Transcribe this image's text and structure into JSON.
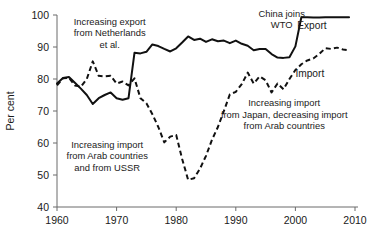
{
  "chart_data": {
    "type": "line",
    "title": "",
    "xlabel": "",
    "ylabel": "Per cent",
    "xlim": [
      1960,
      2010
    ],
    "ylim": [
      40,
      100
    ],
    "grid": false,
    "legend_position": "inline-labels",
    "xticks": [
      "1960",
      "1970",
      "1980",
      "1990",
      "2000",
      "2010"
    ],
    "yticks": [
      "40",
      "50",
      "60",
      "70",
      "80",
      "90",
      "100"
    ],
    "x": [
      1960,
      1961,
      1962,
      1963,
      1964,
      1965,
      1966,
      1967,
      1968,
      1969,
      1970,
      1971,
      1972,
      1973,
      1974,
      1975,
      1976,
      1977,
      1978,
      1979,
      1980,
      1981,
      1982,
      1983,
      1984,
      1985,
      1986,
      1987,
      1988,
      1989,
      1990,
      1991,
      1992,
      1993,
      1994,
      1995,
      1996,
      1997,
      1998,
      1999,
      2000,
      2001,
      2002,
      2003,
      2004,
      2005,
      2006,
      2007,
      2008,
      2009
    ],
    "series": [
      {
        "name": "Export",
        "style": "solid",
        "values": [
          78.6,
          80.3,
          80.6,
          78.8,
          77.0,
          75.0,
          72.2,
          74.0,
          75.0,
          75.8,
          74.0,
          73.5,
          74.0,
          88.2,
          88.0,
          88.5,
          90.8,
          90.3,
          89.4,
          88.6,
          89.6,
          91.4,
          93.3,
          92.2,
          92.6,
          91.6,
          92.4,
          91.8,
          92.0,
          91.2,
          92.0,
          91.0,
          90.4,
          89.0,
          89.4,
          89.4,
          87.8,
          86.7,
          86.6,
          86.8,
          90.2,
          99.3,
          99.3,
          99.2,
          99.2,
          99.3,
          99.3,
          99.3,
          99.3,
          99.3
        ]
      },
      {
        "name": "Import",
        "style": "dashed",
        "values": [
          78.0,
          80.2,
          80.4,
          78.0,
          77.6,
          80.0,
          85.5,
          81.0,
          80.8,
          81.0,
          78.6,
          79.2,
          78.0,
          80.2,
          74.0,
          72.4,
          69.0,
          65.0,
          60.2,
          62.0,
          62.5,
          55.0,
          48.5,
          49.0,
          52.0,
          56.0,
          61.0,
          65.0,
          70.0,
          75.2,
          76.0,
          78.4,
          82.0,
          78.6,
          80.8,
          79.6,
          75.8,
          78.6,
          76.8,
          80.0,
          82.8,
          84.6,
          85.8,
          86.4,
          87.8,
          89.6,
          89.4,
          89.8,
          89.2,
          89.0
        ]
      }
    ],
    "annotations": [
      {
        "id": "export-netherlands",
        "lines": [
          "Increasing export",
          "from Netherlands",
          "et al."
        ],
        "x": 1962.8,
        "y": 97.0,
        "align": "start"
      },
      {
        "id": "import-arab-ussr",
        "lines": [
          "Increasing import",
          "from Arab countries",
          "and from USSR"
        ],
        "x": 1961.6,
        "y": 58.5,
        "align": "start"
      },
      {
        "id": "china-joins-wto",
        "lines": [
          "China joins",
          "WTO"
        ],
        "x": 1993.8,
        "y": 99.5,
        "align": "start"
      },
      {
        "id": "import-japan-arab",
        "lines": [
          "Increasing import",
          "from Japan, decreasing import",
          "from Arab countries"
        ],
        "x": 1987.5,
        "y": 71.5,
        "align": "start"
      }
    ],
    "series_labels": [
      {
        "id": "export-label",
        "text": "Export",
        "x": 2000.3,
        "y": 95.5
      },
      {
        "id": "import-label",
        "text": "Import",
        "x": 2000.0,
        "y": 80.5
      }
    ]
  }
}
